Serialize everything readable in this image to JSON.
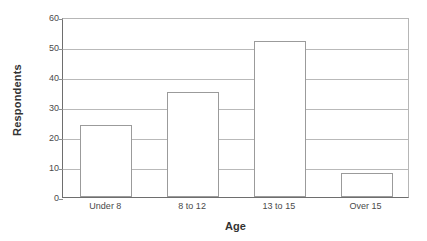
{
  "chart_data": {
    "type": "bar",
    "title": "",
    "subtitle": "",
    "xlabel": "Age",
    "ylabel": "Respondents",
    "categories": [
      "Under 8",
      "8 to 12",
      "13 to 15",
      "Over 15"
    ],
    "values": [
      24,
      35,
      52,
      8
    ],
    "series": [
      {
        "name": "Respondents",
        "values": [
          24,
          35,
          52,
          8
        ]
      }
    ],
    "ylim": [
      0,
      60
    ],
    "yticks": [
      0,
      10,
      20,
      30,
      40,
      50,
      60
    ],
    "ytick_labels": [
      "0",
      "10",
      "20",
      "30",
      "40",
      "50",
      "60"
    ],
    "grid": "horizontal",
    "legend": "none",
    "bar_fill_color": "#ffffff",
    "bar_border_color": "#9b9b9b",
    "gridline_color": "#b9b9b9",
    "axis_color": "#6e6e6e",
    "text_color": "#4a4a4a",
    "background_color": "#ffffff",
    "annotations": []
  }
}
